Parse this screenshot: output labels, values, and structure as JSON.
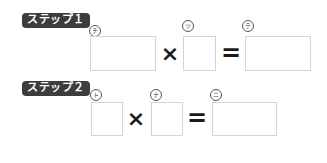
{
  "steps": [
    {
      "label": "ステップ１",
      "operands": [
        {
          "marker": "チ",
          "value": ""
        },
        {
          "marker": "ツ",
          "value": ""
        }
      ],
      "result": {
        "marker": "テ",
        "value": ""
      }
    },
    {
      "label": "ステップ２",
      "operands": [
        {
          "marker": "ト",
          "value": ""
        },
        {
          "marker": "ナ",
          "value": ""
        }
      ],
      "result": {
        "marker": "ニ",
        "value": ""
      }
    }
  ],
  "symbols": {
    "times": "×",
    "equals": "="
  },
  "colors": {
    "badge_bg": "#3d3d3d",
    "badge_text": "#ffffff",
    "box_border": "#d4d4d4",
    "operator": "#1a1a1a"
  }
}
